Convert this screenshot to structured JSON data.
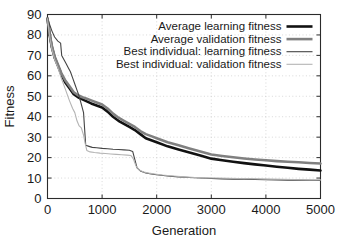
{
  "chart_data": {
    "type": "line",
    "title": "",
    "xlabel": "Generation",
    "ylabel": "Fitness",
    "xlim": [
      0,
      5000
    ],
    "ylim": [
      0,
      90
    ],
    "xticks": [
      0,
      1000,
      2000,
      3000,
      4000,
      5000
    ],
    "yticks": [
      0,
      10,
      20,
      30,
      40,
      50,
      60,
      70,
      80,
      90
    ],
    "xtick_labels": [
      "0",
      "1000",
      "2000",
      "3000",
      "4000",
      "5000"
    ],
    "ytick_labels": [
      "0",
      "10",
      "20",
      "30",
      "40",
      "50",
      "60",
      "70",
      "80",
      "90"
    ],
    "grid": true,
    "grid_style": "dotted",
    "legend_position": "top-right",
    "series": [
      {
        "name": "Average learning fitness",
        "color": "#111111",
        "width": 2.6,
        "x": [
          0,
          40,
          80,
          130,
          190,
          250,
          320,
          400,
          480,
          560,
          640,
          720,
          800,
          900,
          1000,
          1100,
          1200,
          1300,
          1400,
          1500,
          1600,
          1700,
          1800,
          1900,
          2000,
          2200,
          2400,
          2600,
          2800,
          3000,
          3200,
          3400,
          3600,
          3800,
          4000,
          4200,
          4400,
          4600,
          4800,
          5000
        ],
        "y": [
          88,
          80,
          74,
          69,
          65,
          61,
          57,
          54,
          51,
          49.5,
          48.5,
          47.5,
          46.5,
          45.5,
          44.5,
          42.5,
          40,
          38,
          36.5,
          35,
          33.5,
          31.5,
          29.5,
          28.5,
          27.5,
          25.5,
          24,
          22.5,
          21,
          19.5,
          18.7,
          18,
          17.3,
          16.7,
          16.1,
          15.5,
          15,
          14.5,
          14.1,
          13.7
        ]
      },
      {
        "name": "Average validation fitness",
        "color": "#808080",
        "width": 2.6,
        "x": [
          0,
          40,
          80,
          130,
          190,
          250,
          320,
          400,
          480,
          560,
          640,
          720,
          800,
          900,
          1000,
          1100,
          1200,
          1300,
          1400,
          1500,
          1600,
          1700,
          1800,
          1900,
          2000,
          2200,
          2400,
          2600,
          2800,
          3000,
          3200,
          3400,
          3600,
          3800,
          4000,
          4200,
          4400,
          4600,
          4800,
          5000
        ],
        "y": [
          88,
          80.5,
          74.5,
          69.5,
          65.5,
          61.5,
          58,
          55,
          52,
          50.5,
          49.5,
          48.8,
          48,
          47,
          46,
          44,
          41.5,
          39.5,
          38,
          36.5,
          35,
          33,
          31.5,
          30.5,
          29.5,
          27.5,
          26,
          24.5,
          23,
          21.5,
          20.8,
          20.2,
          19.6,
          19.1,
          18.7,
          18.3,
          18,
          17.7,
          17.4,
          17.1
        ]
      },
      {
        "name": "Best individual: learning fitness",
        "color": "#444444",
        "width": 1.1,
        "x": [
          0,
          40,
          80,
          130,
          190,
          240,
          260,
          300,
          340,
          380,
          420,
          460,
          500,
          540,
          580,
          620,
          660,
          680,
          700,
          760,
          820,
          900,
          1000,
          1100,
          1200,
          1300,
          1400,
          1500,
          1560,
          1600,
          1640,
          1700,
          1800,
          1900,
          2000,
          2200,
          2400,
          2600,
          2800,
          3000,
          3200,
          3400,
          3600,
          3800,
          4000,
          4200,
          4400,
          4600,
          4800,
          5000
        ],
        "y": [
          88,
          85,
          82,
          79,
          77,
          76,
          70,
          68,
          66,
          64,
          62,
          59,
          56,
          53,
          50,
          46,
          42,
          34,
          26,
          25.5,
          25,
          24.8,
          24.5,
          24.3,
          24.1,
          24,
          23.8,
          23.6,
          23,
          19,
          15,
          13.5,
          12.5,
          12,
          11.6,
          11,
          10.6,
          10.3,
          10,
          9.8,
          9.6,
          9.5,
          9.4,
          9.3,
          9.2,
          9.1,
          9,
          9,
          8.9,
          8.8
        ]
      },
      {
        "name": "Best individual: validation fitness",
        "color": "#b4b4b4",
        "width": 1.1,
        "x": [
          0,
          40,
          80,
          130,
          190,
          250,
          320,
          400,
          460,
          500,
          540,
          580,
          620,
          660,
          690,
          720,
          780,
          860,
          960,
          1060,
          1160,
          1260,
          1360,
          1460,
          1530,
          1570,
          1620,
          1680,
          1760,
          1860,
          1960,
          2100,
          2300,
          2500,
          2700,
          2900,
          3100,
          3300,
          3500,
          3700,
          3900,
          4100,
          4300,
          4500,
          4700,
          4900,
          5000
        ],
        "y": [
          88,
          79,
          73,
          68,
          64,
          59,
          54,
          48,
          44,
          42,
          38,
          35.5,
          34.5,
          31,
          27,
          23.5,
          22.8,
          22.5,
          22.2,
          22,
          21.8,
          21.6,
          21.4,
          21.2,
          21,
          19.5,
          16,
          14,
          13,
          12.4,
          12,
          11.5,
          11,
          10.6,
          10.3,
          10.1,
          10,
          9.9,
          9.8,
          9.7,
          9.6,
          9.5,
          9.4,
          9.3,
          9.2,
          9.1,
          9.1
        ]
      }
    ]
  },
  "legend": {
    "items": [
      {
        "label": "Average learning fitness"
      },
      {
        "label": "Average validation fitness"
      },
      {
        "label": "Best individual: learning fitness"
      },
      {
        "label": "Best individual: validation fitness"
      }
    ]
  }
}
